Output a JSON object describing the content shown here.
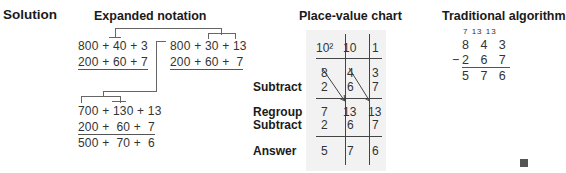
{
  "solution_label": "Solution",
  "expanded_notation": {
    "title": "Expanded notation",
    "step1": {
      "top": "800 + 40 + 3",
      "bottom": "200 + 60 + 7"
    },
    "step2": {
      "top": "800 + 30 + 13",
      "bottom": "200 + 60 +  7"
    },
    "step3": {
      "top": "700 + 130 + 13",
      "middle": "200 +  60 +  7",
      "result": "500 +  70 +  6"
    }
  },
  "place_value_chart": {
    "title": "Place-value chart",
    "headers": [
      "10²",
      "10",
      "1"
    ],
    "rows": [
      {
        "label": "",
        "values": [
          "8",
          "4",
          "3"
        ]
      },
      {
        "label": "Subtract",
        "values": [
          "2",
          "6",
          "7"
        ]
      },
      {
        "label": "Regroup",
        "values": [
          "7",
          "13",
          "13"
        ]
      },
      {
        "label": "Subtract",
        "values": [
          "2",
          "6",
          "7"
        ]
      },
      {
        "label": "Answer",
        "values": [
          "5",
          "7",
          "6"
        ]
      }
    ],
    "background": "#f2f2f2"
  },
  "traditional_algorithm": {
    "title": "Traditional algorithm",
    "regroup_marks": "7 13 13",
    "minuend": "8 4 3",
    "operator": "−",
    "subtrahend": "2 6 7",
    "difference": "5 7 6"
  },
  "end_mark": "■"
}
